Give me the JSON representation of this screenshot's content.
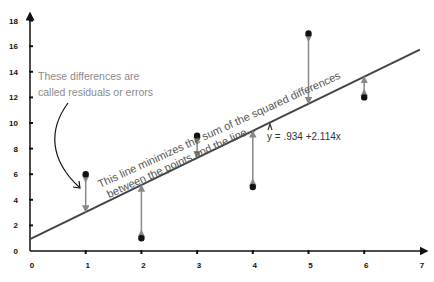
{
  "chart_data": {
    "type": "scatter",
    "title": "",
    "xlabel": "",
    "ylabel": "",
    "xlim": [
      0,
      7
    ],
    "ylim": [
      0,
      18
    ],
    "x_ticks": [
      "0",
      "1",
      "2",
      "3",
      "4",
      "5",
      "6",
      "7"
    ],
    "y_ticks": [
      "0",
      "2",
      "4",
      "6",
      "8",
      "10",
      "12",
      "14",
      "16",
      "18"
    ],
    "grid": false,
    "series": [
      {
        "name": "points",
        "x": [
          1,
          2,
          3,
          4,
          5,
          6
        ],
        "y": [
          6,
          1,
          9,
          5,
          17,
          12
        ]
      }
    ],
    "regression_line": {
      "intercept": 0.934,
      "slope": 2.114,
      "equation_label": "y = .934 +2.114x"
    },
    "annotations": {
      "residual_note_line1": "These differences are",
      "residual_note_line2": "called residuals or errors",
      "line_note_line1": "This line minimizes the sum of the squared differences",
      "line_note_line2": "between the points and the line..."
    }
  }
}
